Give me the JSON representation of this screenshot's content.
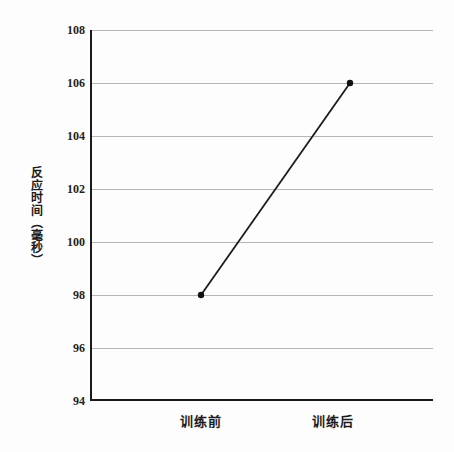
{
  "chart_data": {
    "type": "line",
    "categories": [
      "训练前",
      "训练后"
    ],
    "values": [
      98,
      106
    ],
    "title": "",
    "xlabel": "",
    "ylabel": "反应时间（毫秒）",
    "ylim": [
      94,
      108
    ],
    "yticks": [
      94,
      96,
      98,
      100,
      102,
      104,
      106,
      108
    ],
    "grid": true,
    "legend": false,
    "colors": {
      "line": "#1c1c1c",
      "marker": "#111111",
      "grid": "#b5b5b5",
      "axis": "#1a1a1a",
      "background": "#fdfdfd",
      "text": "#1c1c1c"
    }
  }
}
